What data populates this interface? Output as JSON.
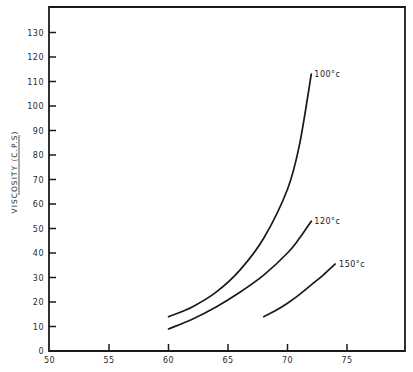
{
  "chart_data": {
    "type": "line",
    "title": "",
    "xlabel": "",
    "ylabel": "VISCOSITY (C.P.S)",
    "xlim": [
      50,
      80
    ],
    "ylim": [
      0,
      140
    ],
    "x_ticks": [
      50,
      55,
      60,
      65,
      70,
      75
    ],
    "y_ticks": [
      0,
      10,
      20,
      30,
      40,
      50,
      60,
      70,
      80,
      90,
      100,
      110,
      120,
      130
    ],
    "grid": false,
    "legend": "inline labels at curve ends",
    "series": [
      {
        "name": "100°C",
        "label": "100°c",
        "x": [
          60,
          62,
          64,
          66,
          68,
          70,
          71,
          72
        ],
        "y": [
          14,
          18,
          24,
          33,
          46,
          66,
          84,
          113
        ]
      },
      {
        "name": "120°C",
        "label": "120°c",
        "x": [
          60,
          62,
          64,
          66,
          68,
          70,
          71,
          72
        ],
        "y": [
          9,
          13,
          18,
          24,
          31,
          40,
          46,
          53
        ]
      },
      {
        "name": "150°C",
        "label": "150°c",
        "x": [
          68,
          69,
          70,
          71,
          72,
          73,
          74
        ],
        "y": [
          14,
          16.5,
          19.5,
          23,
          27,
          31,
          35.5
        ]
      }
    ]
  },
  "colors": {
    "line": "#1a1a1a",
    "background": "#ffffff"
  }
}
